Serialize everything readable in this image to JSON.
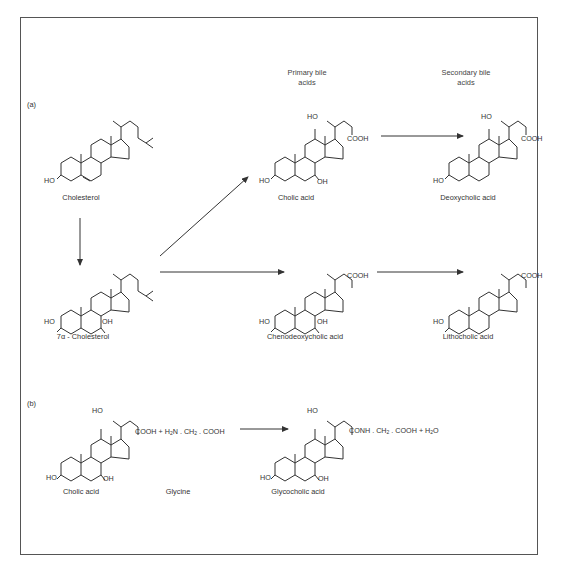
{
  "panels": {
    "a": {
      "label": "(a)"
    },
    "b": {
      "label": "(b)"
    }
  },
  "headers": {
    "primary": [
      "Primary bile",
      "acids"
    ],
    "secondary": [
      "Secondary bile",
      "acids"
    ]
  },
  "compounds": {
    "cholesterol": {
      "name": "Cholesterol"
    },
    "hydroxycholesterol": {
      "name": "7α - Cholesterol"
    },
    "cholic": {
      "name": "Cholic acid"
    },
    "deoxycholic": {
      "name": "Deoxycholic acid"
    },
    "chenodeoxycholic": {
      "name": "Chenodeoxycholic acid"
    },
    "lithocholic": {
      "name": "Lithocholic acid"
    },
    "cholic_b": {
      "name": "Cholic acid"
    },
    "glycine": {
      "name": "Glycine"
    },
    "glycocholic": {
      "name": "Glycocholic acid"
    }
  },
  "groups": {
    "ho": "HO",
    "oh": "OH",
    "cooh": "COOH"
  },
  "equations": {
    "glycine_formula_pre": "COOH + H",
    "glycine_formula_sub2": "2",
    "glycine_formula_mid": "N . CH",
    "glycine_formula_sub2b": "2",
    "glycine_formula_post": ". COOH",
    "product_pre": "CONH . CH",
    "product_sub": "2",
    "product_mid": ". COOH + H",
    "product_sub2": "2",
    "product_post": "O"
  },
  "colors": {
    "line": "#333333",
    "frame": "#555555",
    "text": "#333333"
  }
}
